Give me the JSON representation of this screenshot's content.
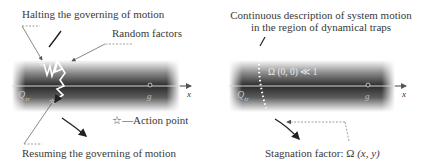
{
  "left_panel": {
    "labels": {
      "halting": "Halting the governing of motion",
      "random_factors": "Random factors",
      "action_point": "☆—Action point",
      "resuming": "Resuming the governing of motion"
    },
    "axis": {
      "x_label": "x",
      "q_label": "Q",
      "q_subscript": "tr",
      "g_label": "g"
    }
  },
  "right_panel": {
    "labels": {
      "continuous_line1": "Continuous description of system motion",
      "continuous_line2": "in the region of dynamical traps",
      "omega_band": "Ω (0, 0) ≪ 1",
      "stagnation_prefix": "Stagnation factor: Ω ",
      "stagnation_args": "(x, y)"
    },
    "axis": {
      "x_label": "x",
      "q_label": "Q",
      "q_subscript": "tr",
      "g_label": "g"
    }
  },
  "colors": {
    "band_dark": "#2a2a2a",
    "axis_line": "#d9d9d9",
    "text": "#3a3a3a",
    "arrow": "#222222"
  }
}
